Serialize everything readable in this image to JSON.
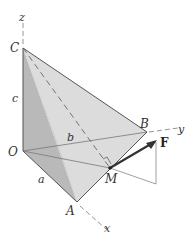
{
  "figure": {
    "colors": {
      "background": "#ffffff",
      "face_left": "#b9b9b9",
      "face_front": "#d2d2d2",
      "face_right": "#e2e2e2",
      "edge": "#555555",
      "axis_dash": "#888888",
      "force_arrow": "#333333",
      "thin_line": "#777777"
    },
    "points": {
      "O": {
        "label": "O",
        "x": 23,
        "y": 151
      },
      "A": {
        "label": "A",
        "x": 77,
        "y": 202
      },
      "B": {
        "label": "B",
        "x": 147,
        "y": 132
      },
      "C": {
        "label": "C",
        "x": 23,
        "y": 48
      },
      "M": {
        "label": "M",
        "x": 110,
        "y": 168
      }
    },
    "axes": {
      "x": {
        "label": "x"
      },
      "y": {
        "label": "y"
      },
      "z": {
        "label": "z"
      }
    },
    "dimensions": {
      "a": "a",
      "b": "b",
      "c": "c"
    },
    "force": {
      "label": "F"
    }
  }
}
